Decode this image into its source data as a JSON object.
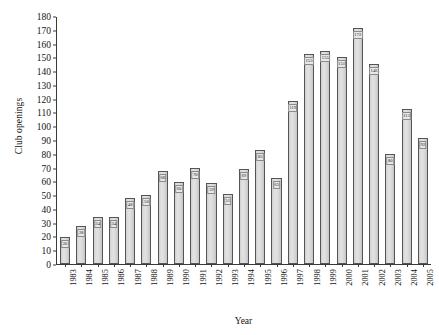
{
  "chart_data": {
    "type": "bar",
    "title": "",
    "xlabel": "Year",
    "ylabel": "Club openings",
    "ylim": [
      0,
      180
    ],
    "ytick_step": 10,
    "grid": false,
    "legend": null,
    "bar_color": "#d9d9d9",
    "bar_border_color": "#555555",
    "axis_color": "#3a3a3a",
    "categories": [
      "1983",
      "1984",
      "1985",
      "1986",
      "1987",
      "1988",
      "1989",
      "1990",
      "1991",
      "1992",
      "1993",
      "1994",
      "1995",
      "1996",
      "1997",
      "1998",
      "1999",
      "2000",
      "2001",
      "2002",
      "2003",
      "2004",
      "2005"
    ],
    "values": [
      20,
      28,
      34,
      34,
      48,
      50,
      68,
      60,
      70,
      59,
      51,
      69,
      83,
      63,
      119,
      153,
      155,
      151,
      172,
      146,
      80,
      113,
      92
    ],
    "yticks": [
      "0",
      "10",
      "20",
      "30",
      "40",
      "50",
      "60",
      "70",
      "80",
      "90",
      "100",
      "110",
      "120",
      "130",
      "140",
      "150",
      "160",
      "170",
      "180"
    ]
  },
  "caption": {
    "text": ""
  }
}
